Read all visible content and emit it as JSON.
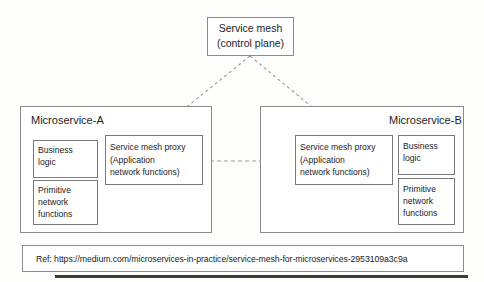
{
  "diagram": {
    "control_plane": {
      "label": "Service mesh\n(control plane)"
    },
    "microservice_a": {
      "title": "Microservice-A",
      "business_logic": "Business\nlogic",
      "primitive_network_functions": "Primitive\nnetwork\nfunctions",
      "proxy": "Service mesh proxy\n(Application\nnetwork functions)"
    },
    "microservice_b": {
      "title": "Microservice-B",
      "business_logic": "Business\nlogic",
      "primitive_network_functions": "Primitive\nnetwork\nfunctions",
      "proxy": "Service mesh proxy\n(Application\nnetwork functions)"
    },
    "reference": {
      "label": "Ref: https://medium.com/microservices-in-practice/service-mesh-for-microservices-2953109a3c9a"
    },
    "colors": {
      "background": "#fdfdfc",
      "box_border": "#8c8c8c",
      "text": "#1c1c1c",
      "connector": "#9a9a9a",
      "bottom_rule": "#3c3c3c"
    }
  }
}
